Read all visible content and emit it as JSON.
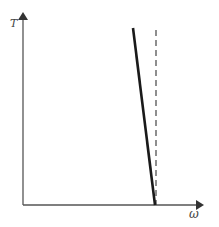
{
  "diagram": {
    "y_axis_label": "T",
    "x_axis_label": "ω",
    "colors": {
      "axis": "#555555",
      "solid_line": "#1a1a1a",
      "dashed_line": "#444444",
      "label": "#444444"
    },
    "elements": [
      {
        "type": "axis",
        "name": "y-axis",
        "from": [
          23,
          205
        ],
        "to": [
          23,
          10
        ],
        "arrow": true
      },
      {
        "type": "axis",
        "name": "x-axis",
        "from": [
          23,
          205
        ],
        "to": [
          206,
          205
        ],
        "arrow": true
      },
      {
        "type": "line",
        "name": "thick-solid-line",
        "from": [
          133,
          28
        ],
        "to": [
          155,
          205
        ],
        "style": "solid"
      },
      {
        "type": "line",
        "name": "dashed-vertical-line",
        "from": [
          156,
          30
        ],
        "to": [
          156,
          205
        ],
        "style": "dashed"
      }
    ]
  }
}
